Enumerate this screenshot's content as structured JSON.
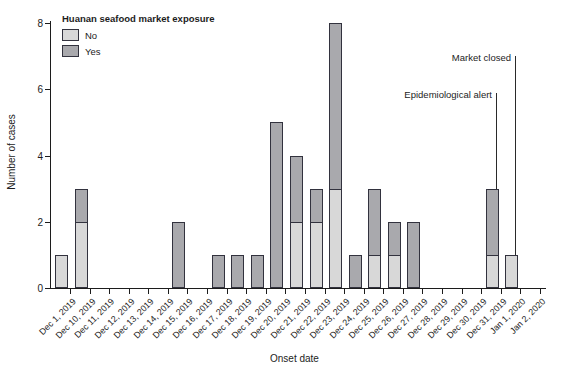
{
  "chart_data": {
    "type": "bar",
    "stacked": true,
    "legend_title": "Huanan seafood market exposure",
    "legend_position": "top-left",
    "xlabel": "Onset date",
    "ylabel": "Number of cases",
    "ylim": [
      0,
      8
    ],
    "yticks": [
      0,
      2,
      4,
      6,
      8
    ],
    "grid": false,
    "categories": [
      "Dec 1, 2019",
      "Dec 10, 2019",
      "Dec 11, 2019",
      "Dec 12, 2019",
      "Dec 13, 2019",
      "Dec 14, 2019",
      "Dec 15, 2019",
      "Dec 16, 2019",
      "Dec 17, 2019",
      "Dec 18, 2019",
      "Dec 19, 2019",
      "Dec 20, 2019",
      "Dec 21, 2019",
      "Dec 22, 2019",
      "Dec 23, 2019",
      "Dec 24, 2019",
      "Dec 25, 2019",
      "Dec 26, 2019",
      "Dec 27, 2019",
      "Dec 28, 2019",
      "Dec 29, 2019",
      "Dec 30, 2019",
      "Dec 31, 2019",
      "Jan 1, 2020",
      "Jan 2, 2020"
    ],
    "series": [
      {
        "name": "No",
        "color": "#d8d8d8",
        "values": [
          1,
          2,
          0,
          0,
          0,
          0,
          0,
          0,
          0,
          0,
          0,
          0,
          2,
          2,
          3,
          0,
          1,
          1,
          0,
          0,
          0,
          0,
          1,
          1,
          0
        ]
      },
      {
        "name": "Yes",
        "color": "#a9a9ad",
        "values": [
          0,
          1,
          0,
          0,
          0,
          0,
          2,
          0,
          1,
          1,
          1,
          5,
          2,
          1,
          5,
          1,
          2,
          1,
          2,
          0,
          0,
          0,
          2,
          0,
          0
        ]
      }
    ],
    "annotations": [
      {
        "label": "Epidemiological alert",
        "category": "Dec 31, 2019",
        "line_from_value": 5.9,
        "line_to_value": 3
      },
      {
        "label": "Market closed",
        "category": "Jan 1, 2020",
        "line_from_value": 7.0,
        "line_to_value": 1
      }
    ],
    "style": {
      "bar_outline": "#32323e",
      "axis_color": "#1c1c1c",
      "text_color": "#1c1c1c",
      "background": "#ffffff"
    }
  }
}
